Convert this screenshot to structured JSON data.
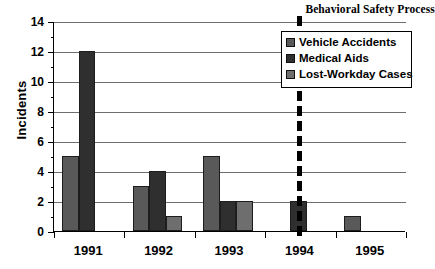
{
  "chart_data": {
    "type": "bar",
    "title": "",
    "xlabel": "",
    "ylabel": "Incidents",
    "ylim": [
      0,
      14
    ],
    "ytick_step": 2,
    "minor_ticks": true,
    "grid": "horizontal",
    "legend_position": "top-right",
    "categories": [
      "1991",
      "1992",
      "1993",
      "1994",
      "1995"
    ],
    "series": [
      {
        "name": "Vehicle Accidents",
        "color": "#595959",
        "values": [
          5,
          3,
          5,
          0,
          1
        ]
      },
      {
        "name": "Medical Aids",
        "color": "#2f2f2f",
        "values": [
          12,
          4,
          2,
          2,
          0
        ]
      },
      {
        "name": "Lost-Workday Cases",
        "color": "#6e6e6e",
        "values": [
          0,
          1,
          2,
          0,
          0
        ]
      }
    ],
    "ytick_labels": [
      "0",
      "2",
      "4",
      "6",
      "8",
      "10",
      "12",
      "14"
    ],
    "ytick_values": [
      0,
      2,
      4,
      6,
      8,
      10,
      12,
      14
    ],
    "minor_tick_values": [
      1,
      3,
      5,
      7,
      9,
      11,
      13
    ],
    "annotations": [
      {
        "name": "behavioral-safety-process",
        "label": "Behavioral Safety Process",
        "type": "vertical-dashed-line",
        "x_position": 3.5,
        "color": "#000000"
      }
    ]
  },
  "axis": {
    "y_title": "Incidents"
  }
}
